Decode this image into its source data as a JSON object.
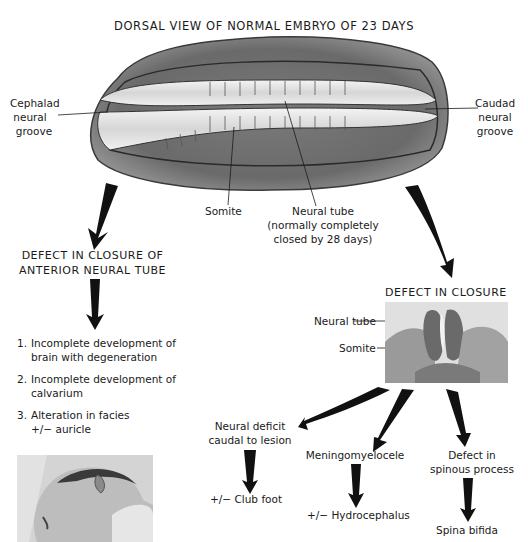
{
  "title": "DORSAL VIEW OF NORMAL EMBRYO OF 23 DAYS",
  "embryo_labels": {
    "cephalad": [
      "Cephalad",
      "neural",
      "groove"
    ],
    "caudad": [
      "Caudad",
      "neural",
      "groove"
    ],
    "somite": "Somite",
    "neural_tube": [
      "Neural tube",
      "(normally completely",
      "closed by 28 days)"
    ]
  },
  "left_branch": {
    "heading": [
      "DEFECT IN CLOSURE OF",
      "ANTERIOR NEURAL TUBE"
    ],
    "items": [
      {
        "num": "1.",
        "lines": [
          "Incomplete development of",
          "brain with degeneration"
        ]
      },
      {
        "num": "2.",
        "lines": [
          "Incomplete development of",
          "calvarium"
        ]
      },
      {
        "num": "3.",
        "lines": [
          "Alteration in facies",
          "+/− auricle"
        ]
      }
    ],
    "photo": "infant-head-photo"
  },
  "right_branch": {
    "heading": "DEFECT IN CLOSURE",
    "section_labels": {
      "neural_tube": "Neural tube",
      "somite": "Somite"
    },
    "photo": "histology-cross-section-photo",
    "outcomes": [
      {
        "label": [
          "Neural deficit",
          "caudal to lesion"
        ],
        "result": "+/− Club foot"
      },
      {
        "label": [
          "Meningomyelocele"
        ],
        "result": "+/− Hydrocephalus"
      },
      {
        "label": [
          "Defect in",
          "spinous process"
        ],
        "result": "Spina bifida"
      }
    ]
  },
  "colors": {
    "ink": "#1a1a1a",
    "embryo_dark": "#5a5a5a",
    "embryo_mid": "#8a8a8a",
    "embryo_light": "#e8e8e8",
    "background": "#ffffff"
  }
}
